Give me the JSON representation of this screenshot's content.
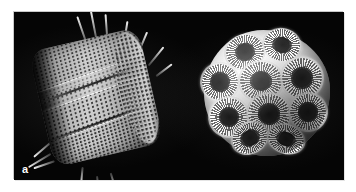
{
  "figure": {
    "name": "sem-micrograph-figure",
    "background_color": "#ffffff",
    "plate_color": "#050505",
    "label_color": "#ffffff",
    "panels": [
      {
        "label": "a",
        "subject": "diatom-frustule",
        "description": "Scanning electron micrograph of a barrel-shaped diatom frustule showing regular rows of pores (areolae), a central girdle band and long radiating spines."
      },
      {
        "label": "b",
        "subject": "coccolithophore",
        "description": "Scanning electron micrograph of a spherical coccosphere built from overlapping disc-shaped coccolith plates with radiating calcite elements and central openings."
      }
    ]
  }
}
